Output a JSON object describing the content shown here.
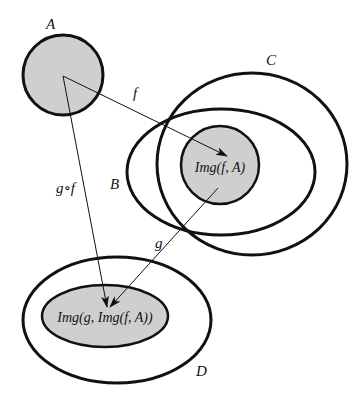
{
  "diagram": {
    "colors": {
      "fill": "#cfcfcf",
      "stroke": "#111111",
      "background": "#ffffff"
    },
    "sets": {
      "A": {
        "label": "A"
      },
      "B": {
        "label": "B"
      },
      "C": {
        "label": "C"
      },
      "D": {
        "label": "D"
      },
      "img_f_A": {
        "label": "Img(f, A)"
      },
      "img_g_img_f_A": {
        "label": "Img(g, Img(f, A))"
      }
    },
    "arrows": {
      "f": {
        "label": "f",
        "from": "A",
        "to": "Img(f, A)"
      },
      "g": {
        "label": "g",
        "from": "Img(f, A)",
        "to": "Img(g, Img(f, A))"
      },
      "gf": {
        "label": "g∘f",
        "from": "A",
        "to": "Img(g, Img(f, A))"
      }
    }
  }
}
